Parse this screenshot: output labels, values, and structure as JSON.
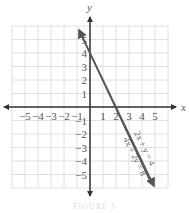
{
  "chart_data": {
    "type": "line",
    "title": "",
    "xlabel": "x",
    "ylabel": "y",
    "xlim": [
      -6,
      6
    ],
    "ylim": [
      -6,
      6
    ],
    "grid": true,
    "x_ticks": [
      "-5",
      "-4",
      "-3",
      "-2",
      "-1",
      "1",
      "2",
      "3",
      "4",
      "5"
    ],
    "y_ticks": [
      "5",
      "4",
      "3",
      "2",
      "1",
      "-1",
      "-2",
      "-3",
      "-4",
      "-5"
    ],
    "series": [
      {
        "name": "2x + y = 4",
        "equation": "y = -2x + 4",
        "points": [
          [
            -0.8,
            5.6
          ],
          [
            0,
            4
          ],
          [
            2,
            0
          ],
          [
            4.8,
            -5.6
          ]
        ]
      },
      {
        "name": "4x + 2y = 8",
        "equation": "y = -2x + 4",
        "points": [
          [
            -0.8,
            5.6
          ],
          [
            0,
            4
          ],
          [
            2,
            0
          ],
          [
            4.8,
            -5.6
          ]
        ]
      }
    ],
    "annotations": [
      "2x + y = 4",
      "4x + 2y = 8"
    ],
    "line_color": "#555555"
  },
  "labels": {
    "x_axis": "x",
    "y_axis": "y",
    "eq1": "2x + y = 4",
    "eq2": "4x + 2y = 8",
    "caption": "FIGURE 5"
  }
}
